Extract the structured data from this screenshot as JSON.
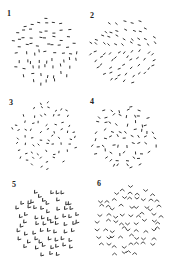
{
  "figure": {
    "panels": [
      {
        "label": "1",
        "label_x": 7,
        "label_y": 10,
        "cx": 45,
        "cy": 51,
        "r": 34,
        "element": "dash",
        "orientation": "horizontal-to-vertical",
        "spacing": 7.2,
        "color": "#333333"
      },
      {
        "label": "2",
        "label_x": 90,
        "label_y": 12,
        "cx": 123,
        "cy": 50,
        "r": 34,
        "element": "dash",
        "orientation": "diagonal",
        "spacing": 7.2,
        "color": "#333333"
      },
      {
        "label": "3",
        "label_x": 9,
        "label_y": 99,
        "cx": 45,
        "cy": 136,
        "r": 34,
        "element": "dash",
        "orientation": "random-short",
        "spacing": 7.2,
        "color": "#333333"
      },
      {
        "label": "4",
        "label_x": 90,
        "label_y": 98,
        "cx": 124,
        "cy": 136,
        "r": 34,
        "element": "dash",
        "orientation": "random",
        "spacing": 7.2,
        "color": "#333333"
      },
      {
        "label": "5",
        "label_x": 12,
        "label_y": 181,
        "cx": 47,
        "cy": 222,
        "r": 35,
        "element": "checkmark",
        "orientation": "lower-left",
        "spacing": 7.5,
        "color": "#333333"
      },
      {
        "label": "6",
        "label_x": 97,
        "label_y": 180,
        "cx": 128,
        "cy": 221,
        "r": 36,
        "element": "chevron",
        "orientation": "up-down",
        "spacing": 7.5,
        "color": "#333333"
      }
    ]
  }
}
